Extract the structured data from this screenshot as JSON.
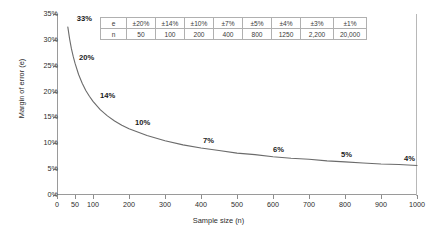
{
  "chart_data": {
    "type": "line",
    "title": "",
    "xlabel": "Sample size (n)",
    "ylabel": "Margin of error (e)",
    "xlim": [
      0,
      1000
    ],
    "ylim": [
      0,
      0.35
    ],
    "grid": true,
    "legend": "none",
    "x_ticks": [
      {
        "value": 0,
        "label": "0"
      },
      {
        "value": 50,
        "label": "50"
      },
      {
        "value": 100,
        "label": "100"
      },
      {
        "value": 200,
        "label": "200"
      },
      {
        "value": 300,
        "label": "300"
      },
      {
        "value": 400,
        "label": "400"
      },
      {
        "value": 500,
        "label": "500"
      },
      {
        "value": 600,
        "label": "600"
      },
      {
        "value": 700,
        "label": "700"
      },
      {
        "value": 800,
        "label": "800"
      },
      {
        "value": 900,
        "label": "900"
      },
      {
        "value": 1000,
        "label": "1000"
      }
    ],
    "y_ticks": [
      {
        "value": 0.0,
        "label": "0%"
      },
      {
        "value": 0.05,
        "label": "5%"
      },
      {
        "value": 0.1,
        "label": "10%"
      },
      {
        "value": 0.15,
        "label": "15%"
      },
      {
        "value": 0.2,
        "label": "20%"
      },
      {
        "value": 0.25,
        "label": "25%"
      },
      {
        "value": 0.3,
        "label": "30%"
      },
      {
        "value": 0.35,
        "label": "35%"
      }
    ],
    "series": [
      {
        "name": "Margin of error vs sample size",
        "color": "#6b6b6b",
        "x": [
          30,
          35,
          40,
          45,
          50,
          60,
          70,
          80,
          90,
          100,
          120,
          140,
          160,
          180,
          200,
          250,
          300,
          350,
          400,
          450,
          500,
          550,
          600,
          650,
          700,
          750,
          800,
          850,
          900,
          950,
          1000
        ],
        "y": [
          0.325,
          0.302,
          0.283,
          0.268,
          0.255,
          0.233,
          0.216,
          0.202,
          0.191,
          0.181,
          0.165,
          0.153,
          0.143,
          0.135,
          0.128,
          0.115,
          0.105,
          0.097,
          0.091,
          0.086,
          0.081,
          0.078,
          0.074,
          0.071,
          0.069,
          0.066,
          0.064,
          0.062,
          0.06,
          0.059,
          0.057
        ]
      }
    ],
    "annotations": [
      {
        "text": "33%",
        "x": 30,
        "y": 0.325
      },
      {
        "text": "20%",
        "x": 50,
        "y": 0.255
      },
      {
        "text": "14%",
        "x": 100,
        "y": 0.181
      },
      {
        "text": "10%",
        "x": 200,
        "y": 0.128
      },
      {
        "text": "7%",
        "x": 400,
        "y": 0.091
      },
      {
        "text": "6%",
        "x": 600,
        "y": 0.074
      },
      {
        "text": "5%",
        "x": 800,
        "y": 0.064
      },
      {
        "text": "4%",
        "x": 1000,
        "y": 0.057
      }
    ],
    "inset_table": {
      "rows": [
        {
          "header": "e",
          "cells": [
            "±20%",
            "±14%",
            "±10%",
            "±7%",
            "±5%",
            "±4%",
            "±3%",
            "±1%"
          ]
        },
        {
          "header": "n",
          "cells": [
            "50",
            "100",
            "200",
            "400",
            "800",
            "1250",
            "2,200",
            "20,000"
          ]
        }
      ]
    }
  }
}
